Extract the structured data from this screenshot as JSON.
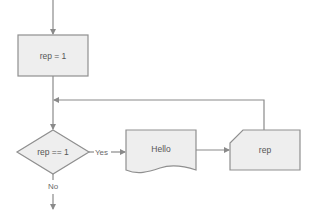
{
  "diagram": {
    "type": "flowchart",
    "nodes": {
      "init": {
        "shape": "process",
        "label": "rep = 1"
      },
      "decision": {
        "shape": "decision",
        "label": "rep == 1"
      },
      "output": {
        "shape": "document",
        "label": "Hello"
      },
      "input": {
        "shape": "card",
        "label": "rep"
      }
    },
    "edges": {
      "yes_label": "Yes",
      "no_label": "No"
    },
    "colors": {
      "fill": "#eeeeee",
      "stroke": "#8f8f8f",
      "text": "#555555"
    }
  }
}
